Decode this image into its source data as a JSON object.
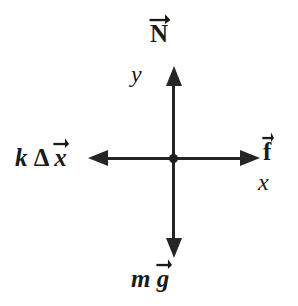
{
  "diagram": {
    "background_color": "#ffffff",
    "stroke_color": "#252525",
    "text_color": "#1a1a1a",
    "origin": {
      "x": 174,
      "y": 159
    },
    "origin_marker": "dot"
  },
  "axes": {
    "x": {
      "label": "x",
      "style": "italic",
      "orientation": "horizontal",
      "arrowheads": [
        "left",
        "right"
      ]
    },
    "y": {
      "label": "y",
      "style": "italic",
      "orientation": "vertical",
      "arrowheads": [
        "up",
        "down"
      ]
    }
  },
  "vectors": [
    {
      "name": "normal-force",
      "direction": "up",
      "label_plain": "N",
      "label_parts": {
        "scalar": "",
        "symbol": "N"
      },
      "symbol_style": "bold-upright",
      "has_vector_arrow": true,
      "tip": {
        "x": 174,
        "y": 66
      }
    },
    {
      "name": "applied-force",
      "direction": "right",
      "label_plain": "f",
      "label_parts": {
        "scalar": "",
        "symbol": "f"
      },
      "symbol_style": "bold-upright",
      "has_vector_arrow": true,
      "tip": {
        "x": 260,
        "y": 159
      }
    },
    {
      "name": "spring-force",
      "direction": "left",
      "label_plain": "kΔx",
      "label_parts": {
        "scalar": "k",
        "delta": "Δ",
        "symbol": "x"
      },
      "symbol_style": "bold-italic",
      "has_vector_arrow": true,
      "tip": {
        "x": 88,
        "y": 159
      }
    },
    {
      "name": "weight-force",
      "direction": "down",
      "label_plain": "mg",
      "label_parts": {
        "scalar": "m",
        "symbol": "g"
      },
      "symbol_style": "bold-italic",
      "has_vector_arrow": true,
      "tip": {
        "x": 174,
        "y": 258
      }
    }
  ]
}
